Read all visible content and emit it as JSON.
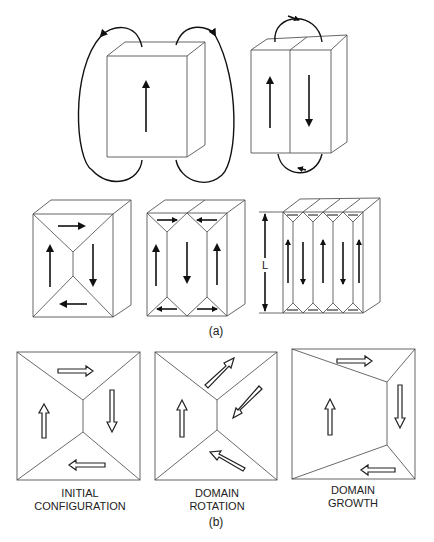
{
  "figure": {
    "part_a_label": "(a)",
    "part_b_label": "(b)",
    "dimension_label": "L",
    "part_a": {
      "row1": [
        {
          "name": "single-domain",
          "domains": [
            "up"
          ],
          "stray_field_loops": 4
        },
        {
          "name": "two-domain",
          "domains": [
            "up",
            "down"
          ],
          "stray_field_loops": 2
        }
      ],
      "row2": [
        {
          "name": "closure-domain-4",
          "domains": [
            "up",
            "right-top",
            "down",
            "left-bottom"
          ]
        },
        {
          "name": "closure-domain-3strip",
          "domains": [
            "up",
            "down",
            "up"
          ]
        },
        {
          "name": "closure-domain-5strip",
          "domains": [
            "up",
            "down",
            "up",
            "down",
            "up"
          ]
        }
      ]
    },
    "part_b": [
      {
        "caption_line1": "INITIAL",
        "caption_line2": "CONFIGURATION"
      },
      {
        "caption_line1": "DOMAIN",
        "caption_line2": "ROTATION"
      },
      {
        "caption_line1": "DOMAIN",
        "caption_line2": "GROWTH"
      }
    ]
  }
}
